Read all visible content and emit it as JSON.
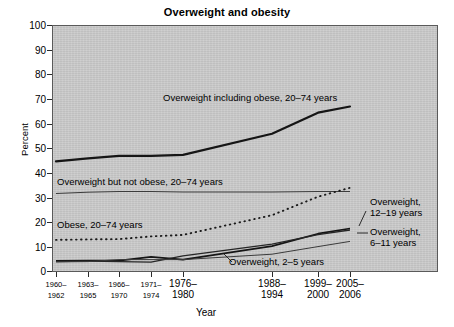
{
  "chart_data": {
    "type": "line",
    "title": "Overweight and obesity",
    "xlabel": "Year",
    "ylabel": "Percent",
    "ylim": [
      0,
      100
    ],
    "ytick_values": [
      0,
      10,
      20,
      30,
      40,
      50,
      60,
      70,
      80,
      90,
      100
    ],
    "ytick_labels": [
      "0",
      "10",
      "20",
      "30",
      "40",
      "50",
      "60",
      "70",
      "80",
      "90",
      "100"
    ],
    "grid": false,
    "legend_position": "inline-annotations",
    "categories": [
      "1960-\n1962",
      "1963-\n1965",
      "1966-\n1970",
      "1971-\n1974",
      "1976-\n1980",
      "1988-\n1994",
      "1999-\n2000",
      "2005-\n2006"
    ],
    "series": [
      {
        "name": "Overweight including obese, 20-74 years",
        "style": "solid-thick",
        "values": [
          44.8,
          46.0,
          47.0,
          47.0,
          47.4,
          56.0,
          64.5,
          67.0
        ]
      },
      {
        "name": "Overweight but not obese, 20-74 years",
        "style": "solid-thin",
        "values": [
          31.8,
          32.3,
          32.6,
          32.6,
          32.4,
          32.4,
          32.6,
          32.6
        ]
      },
      {
        "name": "Obese, 20-74 years",
        "style": "dotted",
        "values": [
          13.0,
          13.2,
          13.3,
          14.4,
          15.0,
          23.0,
          30.5,
          34.1
        ]
      },
      {
        "name": "Overweight, 12-19 years",
        "style": "solid-thick-child",
        "values": [
          4.5,
          4.6,
          4.6,
          6.1,
          5.0,
          10.5,
          15.5,
          17.6
        ]
      },
      {
        "name": "Overweight, 6-11 years",
        "style": "solid-child",
        "values": [
          4.2,
          4.4,
          4.2,
          4.0,
          6.5,
          11.3,
          15.1,
          17.0
        ]
      },
      {
        "name": "Overweight, 2-5 years",
        "style": "solid-thin-child",
        "values": [
          4.1,
          4.2,
          5.0,
          5.0,
          5.0,
          7.2,
          10.3,
          12.4
        ]
      }
    ],
    "annotations": [
      {
        "text": "Overweight including obese, 20-74 years",
        "target_series": "Overweight including obese, 20-74 years"
      },
      {
        "text": "Overweight but not obese, 20-74 years",
        "target_series": "Overweight but not obese, 20-74 years"
      },
      {
        "text": "Obese, 20-74 years",
        "target_series": "Obese, 20-74 years"
      },
      {
        "text": "Overweight, 2-5 years",
        "target_series": "Overweight, 2-5 years"
      },
      {
        "text": "Overweight,\n12-19 years",
        "target_series": "Overweight, 12-19 years"
      },
      {
        "text": "Overweight,\n6-11 years",
        "target_series": "Overweight, 6-11 years"
      }
    ]
  },
  "labels": {
    "title": "Overweight and obesity",
    "yaxis": "Percent",
    "xaxis": "Year",
    "ann_overweight_incl_obese": "Overweight including obese, 20–74 years",
    "ann_overweight_not_obese": "Overweight but not obese, 20–74 years",
    "ann_obese": "Obese, 20–74 years",
    "ann_ow_2_5": "Overweight, 2–5 years",
    "ann_ow_12_19": "Overweight,\n12–19 years",
    "ann_ow_6_11": "Overweight,\n6–11 years"
  },
  "yticks": [
    {
      "label": "100"
    },
    {
      "label": "90"
    },
    {
      "label": "80"
    },
    {
      "label": "70"
    },
    {
      "label": "60"
    },
    {
      "label": "50"
    },
    {
      "label": "40"
    },
    {
      "label": "30"
    },
    {
      "label": "20"
    },
    {
      "label": "10"
    },
    {
      "label": "0"
    }
  ],
  "xticks": [
    {
      "label": "1960–\n1962"
    },
    {
      "label": "1963–\n1965"
    },
    {
      "label": "1966–\n1970"
    },
    {
      "label": "1971–\n1974"
    },
    {
      "label": "1976–\n1980"
    },
    {
      "label": "1988–\n1994"
    },
    {
      "label": "1999–\n2000"
    },
    {
      "label": "2005–\n2006"
    }
  ],
  "colors": {
    "panel": "#cbcbcb",
    "axis": "#2b2b2b",
    "line": "#1a1a1a"
  }
}
